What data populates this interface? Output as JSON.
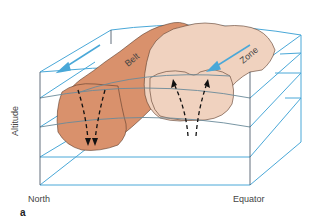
{
  "figure": {
    "panel_label": "a",
    "labels": {
      "belt": "Belt",
      "zone": "Zone",
      "north": "North",
      "equator": "Equator",
      "altitude": "Altitude"
    },
    "colors": {
      "box_lines": "#4aa8d8",
      "box_edges_dark": "#3a4a5a",
      "belt_fill": "#d9916c",
      "zone_fill": "#f0d2bf",
      "cloud_outline": "#5a3a2a",
      "flow_arrow": "#4aa8d8",
      "vertical_arrows": "#111111",
      "isobar_curve": "#6a8a9a"
    },
    "flows": {
      "belt_horizontal": "westward (arrow pointing down-left along top)",
      "zone_horizontal": "arrow pointing down-left along top",
      "belt_vertical": "descending",
      "zone_vertical": "ascending"
    }
  }
}
